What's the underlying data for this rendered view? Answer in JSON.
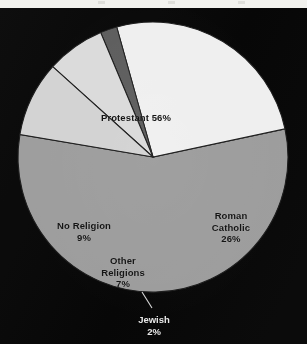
{
  "page": {
    "background_color": "#070707",
    "top_margin_color": "#f2f2ee"
  },
  "chart_data": {
    "type": "pie",
    "title": "",
    "subtitle": "",
    "xlabel": "",
    "ylabel": "",
    "legend_position": "none",
    "grid": false,
    "labels_inside_slices": true,
    "units": "percent",
    "total": 100,
    "categories": [
      "Protestant",
      "Roman Catholic",
      "Jewish",
      "Other Religions",
      "No Religion"
    ],
    "values": [
      56,
      26,
      2,
      7,
      9
    ],
    "slices": [
      {
        "name": "Protestant",
        "label": "Protestant 56%",
        "name_text": "Protestant",
        "value": 56,
        "value_text": "56%",
        "color": "#9c9c9c",
        "start_angle_deg": -12,
        "end_angle_deg": 189.6
      },
      {
        "name": "Roman Catholic",
        "label": "Roman Catholic 26%",
        "name_text": "Roman\nCatholic\n26%",
        "value": 26,
        "value_text": "26%",
        "color": "#efefef",
        "start_angle_deg": -105.6,
        "end_angle_deg": -12
      },
      {
        "name": "Jewish",
        "label": "Jewish 2%",
        "name_text": "Jewish\n2%",
        "value": 2,
        "value_text": "2%",
        "color": "#5c5c5c",
        "start_angle_deg": -112.8,
        "end_angle_deg": -105.6
      },
      {
        "name": "Other Religions",
        "label": "Other Religions 7%",
        "name_text": "Other\nReligions\n7%",
        "value": 7,
        "value_text": "7%",
        "color": "#dadada",
        "start_angle_deg": -138,
        "end_angle_deg": -112.8
      },
      {
        "name": "No Religion",
        "label": "No Religion 9%",
        "name_text": "No Religion\n9%",
        "value": 9,
        "value_text": "9%",
        "color": "#d2d2d2",
        "start_angle_deg": -170.4,
        "end_angle_deg": -138
      }
    ],
    "geometry": {
      "center_x": 153,
      "center_y": 149,
      "radius": 135,
      "slice_edge_color": "#1b1b1b"
    },
    "callouts": [
      {
        "for": "Jewish",
        "text": "Jewish\n2%",
        "text_color": "#e8e8e8",
        "leader_line_color": "#d8d8d8"
      }
    ]
  }
}
